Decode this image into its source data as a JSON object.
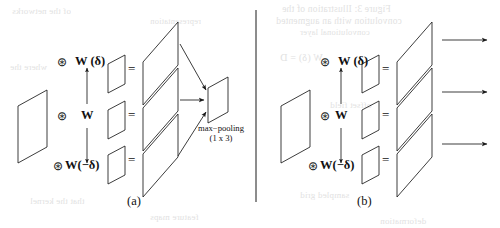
{
  "figure": {
    "kind": "scanned-paper-figure",
    "background_color": "#ffffff",
    "ink_color": "#1a1a1a",
    "bleed_color": "#c9c9c9",
    "panels": [
      {
        "id": "a",
        "caption": "(a)",
        "conv_symbol_top": "⊛",
        "conv_symbol_mid": "⊛",
        "conv_symbol_bot": "⊛",
        "kernel_top_label": "W (δ)",
        "kernel_mid_label": "W",
        "kernel_bot_label": "W(−δ)",
        "equals_top": "=",
        "equals_mid": "=",
        "equals_bot": "=",
        "pool_label_line1": "max−pooling",
        "pool_label_line2": "(1 x 3)",
        "branch_count": 3,
        "has_merge_output": true
      },
      {
        "id": "b",
        "caption": "(b)",
        "conv_symbol_top": "⊛",
        "conv_symbol_mid": "⊛",
        "conv_symbol_bot": "⊛",
        "kernel_top_label": "W (δ)",
        "kernel_mid_label": "W",
        "kernel_bot_label": "W(−δ)",
        "equals_top": "=",
        "equals_mid": "=",
        "equals_bot": "=",
        "branch_count": 3,
        "has_merge_output": false,
        "output_arrow_count": 3
      }
    ],
    "divider": {
      "orientation": "vertical",
      "x": 256,
      "y_top": 10,
      "y_bottom": 202
    },
    "bleed_text": [
      {
        "text": "Figure 3: Illustration of the",
        "x": 282,
        "y": 4,
        "size": 9.5
      },
      {
        "text": "convolution with an augmented",
        "x": 276,
        "y": 16,
        "size": 9.5
      },
      {
        "text": "convolutional layer",
        "x": 300,
        "y": 27,
        "size": 8.5
      },
      {
        "text": "of the networks",
        "x": 12,
        "y": 6,
        "size": 9
      },
      {
        "text": "representation",
        "x": 150,
        "y": 16,
        "size": 8.5
      },
      {
        "text": "W (δ) = D",
        "x": 280,
        "y": 52,
        "size": 10
      },
      {
        "text": "where the",
        "x": 10,
        "y": 62,
        "size": 9
      },
      {
        "text": "offset field",
        "x": 330,
        "y": 100,
        "size": 9
      },
      {
        "text": "that the kernel",
        "x": 30,
        "y": 196,
        "size": 9
      },
      {
        "text": "sampled grid",
        "x": 300,
        "y": 190,
        "size": 9
      },
      {
        "text": "feature maps",
        "x": 150,
        "y": 212,
        "size": 9
      },
      {
        "text": "deformation",
        "x": 380,
        "y": 216,
        "size": 9
      }
    ]
  }
}
